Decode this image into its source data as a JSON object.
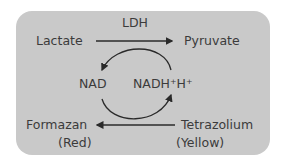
{
  "diagram": {
    "enzyme": "LDH",
    "substrate": "Lactate",
    "product": "Pyruvate",
    "cofactor_oxidized": "NAD",
    "cofactor_reduced": "NADH⁺H⁺",
    "dye_product": "Formazan",
    "dye_product_color": "(Red)",
    "dye_substrate": "Tetrazolium",
    "dye_substrate_color": "(Yellow)"
  },
  "colors": {
    "panel": "#c9c9c9",
    "text": "#3b3b3b",
    "arrow": "#2a2a2a"
  }
}
